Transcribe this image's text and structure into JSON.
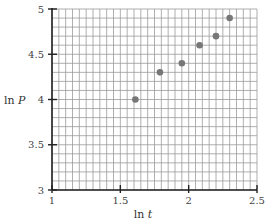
{
  "chart_data": {
    "type": "scatter",
    "title": "",
    "xlabel": "ln t",
    "ylabel": "ln P",
    "xlim": [
      1,
      2.5
    ],
    "ylim": [
      3,
      5
    ],
    "x_ticks": [
      "1",
      "1.5",
      "2",
      "2.5"
    ],
    "y_ticks": [
      "3",
      "3.5",
      "4",
      "4.5",
      "5"
    ],
    "grid": true,
    "grid_x_step": 0.05,
    "grid_y_step": 0.1,
    "legend": null,
    "series": [
      {
        "name": "data",
        "x": [
          1.61,
          1.79,
          1.95,
          2.08,
          2.2,
          2.3
        ],
        "y": [
          4.0,
          4.3,
          4.4,
          4.6,
          4.7,
          4.9
        ],
        "color": "#777777"
      }
    ]
  },
  "labels": {
    "xlabel_main": "ln ",
    "xlabel_var": "t",
    "ylabel_main": "ln ",
    "ylabel_var": "P"
  }
}
